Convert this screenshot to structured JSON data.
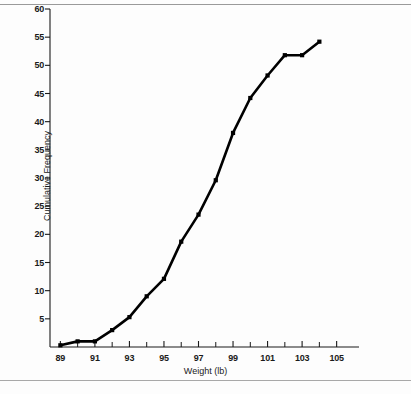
{
  "figure": {
    "background_color": "#fdfdfd",
    "rule_color": "#9a9a9a",
    "line_color": "#000000",
    "marker_color": "#000000",
    "caption": ""
  },
  "chart_data": {
    "type": "line",
    "title": "",
    "subtitle": "",
    "xlabel": "Weight (lb)",
    "ylabel": "Cumulative Frequency",
    "xlim": [
      88.4,
      105.6
    ],
    "ylim": [
      0,
      60
    ],
    "grid": false,
    "legend": "none",
    "x_major_ticks": [
      89,
      91,
      93,
      95,
      97,
      99,
      101,
      103,
      105
    ],
    "x_major_tick_labels": [
      "89",
      "91",
      "93",
      "95",
      "97",
      "99",
      "101",
      "103",
      "105"
    ],
    "x_minor_ticks": [
      90,
      92,
      94,
      96,
      98,
      100,
      102,
      104
    ],
    "y_ticks": [
      5,
      10,
      15,
      20,
      25,
      30,
      35,
      40,
      45,
      50,
      55,
      60
    ],
    "y_tick_labels": [
      "5",
      "10",
      "15",
      "20",
      "25",
      "30",
      "35",
      "40",
      "45",
      "50",
      "55",
      "60"
    ],
    "marker": "square",
    "x": [
      89,
      90,
      91,
      92,
      93,
      94,
      95,
      96,
      97,
      98,
      99,
      100,
      101,
      102,
      103,
      104
    ],
    "values": [
      0.3,
      1.0,
      1.0,
      3.0,
      5.3,
      9.0,
      12.1,
      18.7,
      23.5,
      29.6,
      38.0,
      44.2,
      48.2,
      51.8,
      51.8,
      54.2
    ],
    "series": [
      {
        "name": "Cumulative Frequency",
        "values": [
          0.3,
          1.0,
          1.0,
          3.0,
          5.3,
          9.0,
          12.1,
          18.7,
          23.5,
          29.6,
          38.0,
          44.2,
          48.2,
          51.8,
          51.8,
          54.2
        ]
      }
    ]
  },
  "geometry": {
    "plot_left": 50,
    "plot_right": 347,
    "plot_top": 9,
    "plot_bottom": 347
  }
}
